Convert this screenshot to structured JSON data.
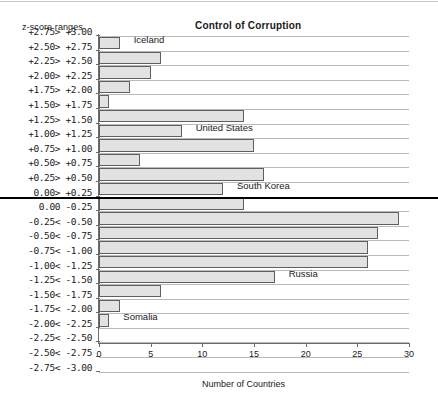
{
  "chart_data": {
    "type": "bar",
    "orientation": "horizontal",
    "title": "Control of Corruption",
    "xlabel": "Number of Countries",
    "ylabel": "z-score ranges",
    "xlim": [
      0,
      30
    ],
    "xticks": [
      0,
      5,
      10,
      15,
      20,
      25,
      30
    ],
    "grid": true,
    "legend": "none",
    "categories": [
      "+2.75> +3.00",
      "+2.50> +2.75",
      "+2.25> +2.50",
      "+2.00> +2.25",
      "+1.75> +2.00",
      "+1.50> +1.75",
      "+1.25> +1.50",
      "+1.00> +1.25",
      "+0.75> +1.00",
      "+0.50> +0.75",
      "+0.25> +0.50",
      " 0.00> +0.25",
      " 0.00  -0.25",
      "-0.25< -0.50",
      "-0.50< -0.75",
      "-0.75< -1.00",
      "-1.00< -1.25",
      "-1.25< -1.50",
      "-1.50< -1.75",
      "-1.75< -2.00",
      "-2.00< -2.25",
      "-2.25< -2.50",
      "-2.50< -2.75",
      "-2.75< -3.00"
    ],
    "values": [
      2,
      6,
      5,
      3,
      1,
      14,
      8,
      15,
      4,
      16,
      12,
      14,
      29,
      27,
      26,
      26,
      17,
      6,
      2,
      1,
      0,
      0,
      0,
      0
    ],
    "annotations": [
      {
        "label": "Iceland",
        "category": "+2.75> +3.00"
      },
      {
        "label": "United States",
        "category": "+1.25> +1.50"
      },
      {
        "label": "South Korea",
        "category": "+0.25> +0.50"
      },
      {
        "label": "Russia",
        "category": "-1.00< -1.25"
      },
      {
        "label": "Somalia",
        "category": "-1.75< -2.00"
      }
    ],
    "zero_divider": true,
    "colors": {
      "bar_fill": "#e2e2e2",
      "bar_edge": "#5f5f5f",
      "axis": "#6b6b6b",
      "grid": "#b9b9b9",
      "zero_line": "#000000",
      "text": "#1a1a1a",
      "background": "#ffffff"
    }
  }
}
